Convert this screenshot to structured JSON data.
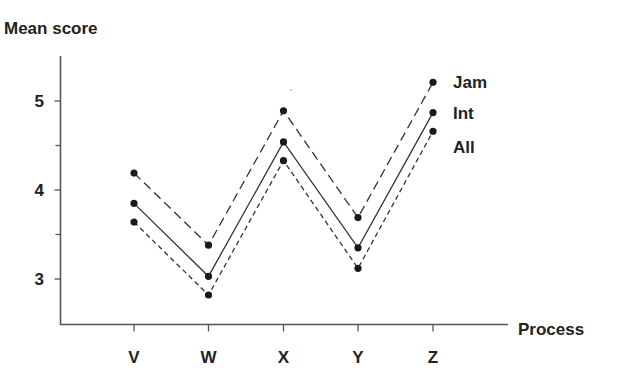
{
  "chart_data": {
    "type": "line",
    "title": "",
    "ylabel": "Mean score",
    "xlabel": "Process",
    "categories": [
      "V",
      "W",
      "X",
      "Y",
      "Z"
    ],
    "ylim": [
      2.5,
      5.5
    ],
    "yticks": [
      3,
      4,
      5
    ],
    "yminor_ticks": [
      3.5,
      4.5
    ],
    "grid": false,
    "legend_position": "inline-right-end",
    "series": [
      {
        "name": "Jam",
        "style": "long-dash",
        "values": [
          4.19,
          3.38,
          4.89,
          3.69,
          5.21
        ]
      },
      {
        "name": "Int",
        "style": "solid",
        "values": [
          3.85,
          3.03,
          4.54,
          3.35,
          4.87
        ]
      },
      {
        "name": "All",
        "style": "short-dash",
        "values": [
          3.64,
          2.82,
          4.33,
          3.12,
          4.66
        ]
      }
    ]
  }
}
